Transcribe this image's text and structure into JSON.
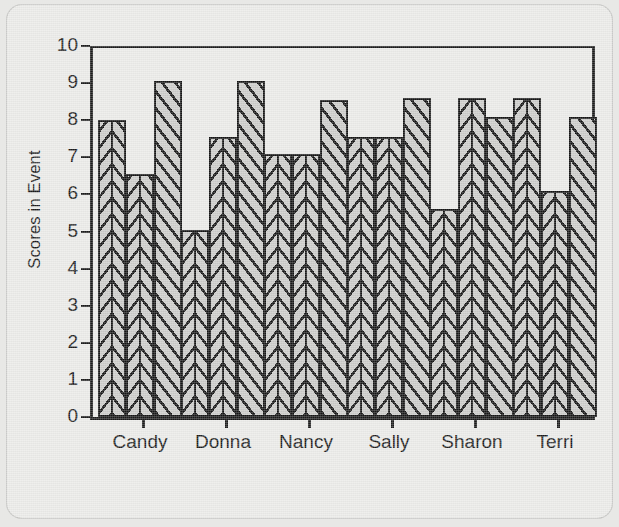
{
  "chart_data": {
    "type": "bar",
    "title": "",
    "subtitle": "",
    "xlabel": "",
    "ylabel": "Scores in Event",
    "ylim": [
      0,
      10
    ],
    "xlim_categories": 6,
    "grid": false,
    "legend": "none",
    "y_ticks": [
      "10",
      "9",
      "8",
      "7",
      "6",
      "5",
      "4",
      "3",
      "2",
      "1",
      "0"
    ],
    "y_tick_values": [
      10,
      9,
      8,
      7,
      6,
      5,
      4,
      3,
      2,
      1,
      0
    ],
    "categories": [
      "Candy",
      "Donna",
      "Nancy",
      "Sally",
      "Sharon",
      "Terri"
    ],
    "series": [
      {
        "name": "Judge 1",
        "pattern": "chevron",
        "values": [
          8.0,
          5.05,
          7.1,
          7.55,
          5.6,
          8.6
        ]
      },
      {
        "name": "Judge 2",
        "pattern": "chevron",
        "values": [
          6.55,
          7.55,
          7.1,
          7.55,
          8.6,
          6.1
        ]
      },
      {
        "name": "Judge 3",
        "pattern": "diagonal",
        "values": [
          9.05,
          9.05,
          8.55,
          8.6,
          8.1,
          8.1
        ]
      }
    ],
    "bar_fill_color": "#c9c9c7",
    "bar_edge_color": "#161616",
    "axis_color": "#1b1b1b",
    "background_color": "#e9e9e7"
  },
  "layout": {
    "groups": [
      {
        "label": "Candy",
        "left": 92,
        "tick_x": 136,
        "label_center": 134
      },
      {
        "label": "Donna",
        "left": 175,
        "tick_x": 219,
        "label_center": 217
      },
      {
        "label": "Nancy",
        "left": 258,
        "tick_x": 302,
        "label_center": 300
      },
      {
        "label": "Sally",
        "left": 341,
        "tick_x": 385,
        "label_center": 383
      },
      {
        "label": "Sharon",
        "left": 424,
        "tick_x": 468,
        "label_center": 466
      },
      {
        "label": "Terri",
        "left": 507,
        "tick_x": 551,
        "label_center": 549
      }
    ],
    "bar_width": 28,
    "plot_top_px": 42,
    "plot_bottom_px": 413
  }
}
